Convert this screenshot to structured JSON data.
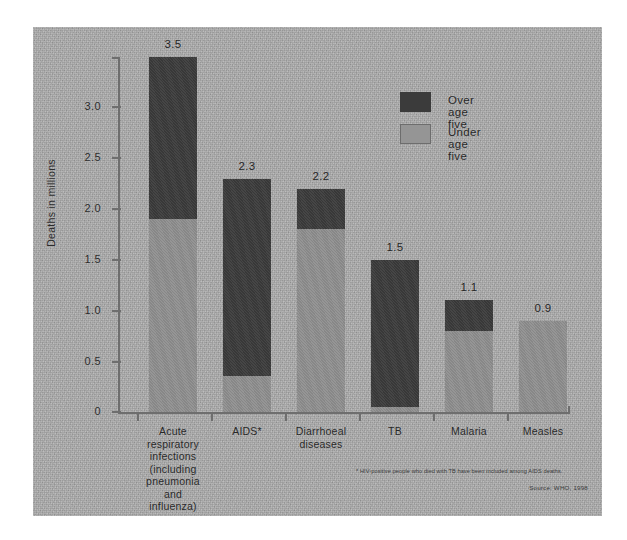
{
  "chart_data": {
    "type": "bar",
    "title": "",
    "subtitle": "",
    "xlabel": "",
    "ylabel": "Deaths in millions",
    "ylim": [
      0,
      3.6
    ],
    "yticks": [
      "0",
      "0.5",
      "1.0",
      "1.5",
      "2.0",
      "2.5",
      "3.0"
    ],
    "ytick_values": [
      0,
      0.5,
      1.0,
      1.5,
      2.0,
      2.5,
      3.0
    ],
    "grid": false,
    "stacked": true,
    "legend_position": "top-right",
    "categories": [
      "Acute respiratory infections (including pneumonia and influenza)",
      "AIDS*",
      "Diarrhoeal diseases",
      "TB",
      "Malaria",
      "Measles"
    ],
    "category_lines": [
      [
        "Acute",
        "respiratory",
        "infections",
        "(including",
        "pneumonia and",
        "influenza)"
      ],
      [
        "AIDS*"
      ],
      [
        "Diarrhoeal",
        "diseases"
      ],
      [
        "TB"
      ],
      [
        "Malaria"
      ],
      [
        "Measles"
      ]
    ],
    "totals": [
      3.5,
      2.3,
      2.2,
      1.5,
      1.1,
      0.9
    ],
    "total_labels": [
      "3.5",
      "2.3",
      "2.2",
      "1.5",
      "1.1",
      "0.9"
    ],
    "series": [
      {
        "name": "Under age five",
        "color": "#8f8f8f",
        "values": [
          1.9,
          0.35,
          1.8,
          0.05,
          0.8,
          0.9
        ]
      },
      {
        "name": "Over age five",
        "color": "#3b3b3b",
        "values": [
          1.6,
          1.95,
          0.4,
          1.45,
          0.3,
          0.0
        ]
      }
    ],
    "annotations": [
      "* HIV-positive people who died with TB have been included among AIDS deaths.",
      "Source: WHO, 1998"
    ]
  },
  "legend": {
    "items": [
      {
        "label": "Over age five",
        "color": "#3b3b3b"
      },
      {
        "label": "Under age five",
        "color": "#959595"
      }
    ]
  },
  "axis": {
    "y_title": "Deaths in millions",
    "ticks": [
      "3.0",
      "2.5",
      "2.0",
      "1.5",
      "1.0",
      "0.5",
      "0"
    ]
  },
  "footnote": "* HIV-positive people who died with TB have been included among AIDS deaths.",
  "source": "Source: WHO, 1998"
}
